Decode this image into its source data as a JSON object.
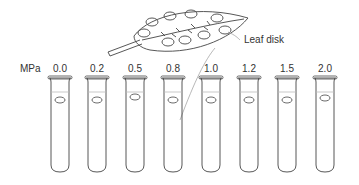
{
  "diagram": {
    "unit_label": "MPa",
    "callout_label": "Leaf disk",
    "tubes": [
      {
        "value": "0.0",
        "x": 60
      },
      {
        "value": "0.2",
        "x": 97
      },
      {
        "value": "0.5",
        "x": 135
      },
      {
        "value": "0.8",
        "x": 173
      },
      {
        "value": "1.0",
        "x": 211
      },
      {
        "value": "1.2",
        "x": 249
      },
      {
        "value": "1.5",
        "x": 287
      },
      {
        "value": "2.0",
        "x": 325
      }
    ]
  }
}
